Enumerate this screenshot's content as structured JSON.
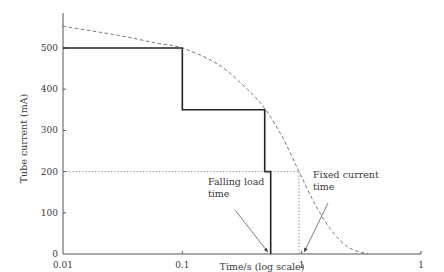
{
  "chart_data": {
    "type": "line",
    "title": "",
    "xlabel": "Time/s (log scale)",
    "ylabel": "Tube current (mA)",
    "xscale": "log",
    "xlim": [
      0.01,
      10
    ],
    "ylim": [
      0,
      600
    ],
    "x_ticks": [
      {
        "value": 0.01,
        "label": "0.01"
      },
      {
        "value": 0.1,
        "label": "0.1"
      },
      {
        "value": 1,
        "label": "1"
      },
      {
        "value": 10,
        "label": "1"
      }
    ],
    "y_ticks": [
      {
        "value": 0,
        "label": "0"
      },
      {
        "value": 100,
        "label": "100"
      },
      {
        "value": 200,
        "label": "200"
      },
      {
        "value": 300,
        "label": "300"
      },
      {
        "value": 400,
        "label": "400"
      },
      {
        "value": 500,
        "label": "500"
      }
    ],
    "grid": false,
    "legend": "none",
    "series": [
      {
        "name": "Falling load",
        "style": "solid",
        "color": "#222222",
        "x": [
          0.01,
          0.1,
          0.1,
          0.49,
          0.49,
          0.55,
          0.55
        ],
        "y": [
          500,
          500,
          350,
          350,
          200,
          200,
          0
        ]
      },
      {
        "name": "Rating limit",
        "style": "dashed",
        "color": "#666666",
        "x": [
          0.01,
          0.03,
          0.06,
          0.1,
          0.2,
          0.35,
          0.5,
          0.7,
          0.95,
          1.3,
          1.8,
          2.5,
          3.6
        ],
        "y": [
          553,
          530,
          512,
          500,
          460,
          400,
          350,
          280,
          200,
          120,
          55,
          15,
          0
        ]
      },
      {
        "name": "Fixed current 200 mA",
        "style": "dotted",
        "color": "#777777",
        "x": [
          0.01,
          0.95,
          0.95
        ],
        "y": [
          200,
          200,
          0
        ]
      }
    ],
    "annotations": [
      {
        "text_lines": [
          "Falling load",
          "time"
        ],
        "arrow_to": {
          "x": 0.52,
          "y": 5
        }
      },
      {
        "text_lines": [
          "Fixed current",
          "time"
        ],
        "arrow_to": {
          "x": 1.05,
          "y": 5
        }
      }
    ]
  }
}
